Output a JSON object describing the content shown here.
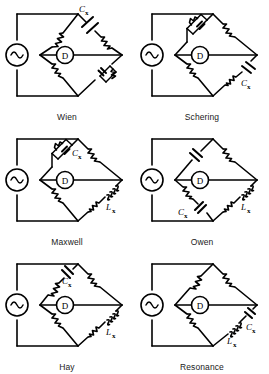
{
  "figure": {
    "ink_color": "#000000",
    "background_color": "#ffffff",
    "columns": 2,
    "rows": 3
  },
  "symbols": {
    "source": "ac-source-sine",
    "detector_label": "D",
    "detector": "detector-circle",
    "resistor": "resistor-zigzag",
    "capacitor": "capacitor-plates",
    "inductor": "inductor-coil"
  },
  "labels": {
    "cx": "C",
    "lx": "L",
    "sub_x": "x"
  },
  "bridges": [
    {
      "id": "wien",
      "name": "Wien",
      "index": 0,
      "detector": "D",
      "source": "ac-source-sine",
      "arms": [
        {
          "position": "top-left",
          "components": [
            "resistor"
          ],
          "label": ""
        },
        {
          "position": "top-right",
          "components": [
            "capacitor",
            "resistor"
          ],
          "label": "Cx"
        },
        {
          "position": "bottom-left",
          "components": [
            "resistor"
          ],
          "label": ""
        },
        {
          "position": "bottom-right",
          "components": [
            "capacitor-parallel-resistor"
          ],
          "label": ""
        }
      ]
    },
    {
      "id": "schering",
      "name": "Schering",
      "index": 1,
      "detector": "D",
      "source": "ac-source-sine",
      "arms": [
        {
          "position": "top-left",
          "components": [
            "resistor-parallel-capacitor"
          ],
          "label": ""
        },
        {
          "position": "top-right",
          "components": [
            "resistor"
          ],
          "label": ""
        },
        {
          "position": "bottom-left",
          "components": [
            "resistor"
          ],
          "label": ""
        },
        {
          "position": "bottom-right",
          "components": [
            "capacitor",
            "resistor"
          ],
          "label": "Cx"
        }
      ]
    },
    {
      "id": "maxwell",
      "name": "Maxwell",
      "index": 2,
      "detector": "D",
      "source": "ac-source-sine",
      "arms": [
        {
          "position": "top-left",
          "components": [
            "resistor-parallel-capacitor"
          ],
          "label": "Cx"
        },
        {
          "position": "top-right",
          "components": [
            "resistor"
          ],
          "label": ""
        },
        {
          "position": "bottom-left",
          "components": [
            "resistor"
          ],
          "label": ""
        },
        {
          "position": "bottom-right",
          "components": [
            "inductor",
            "resistor"
          ],
          "label": "Lx"
        }
      ]
    },
    {
      "id": "owen",
      "name": "Owen",
      "index": 3,
      "detector": "D",
      "source": "ac-source-sine",
      "arms": [
        {
          "position": "top-left",
          "components": [
            "capacitor"
          ],
          "label": ""
        },
        {
          "position": "top-right",
          "components": [
            "resistor"
          ],
          "label": ""
        },
        {
          "position": "bottom-left",
          "components": [
            "resistor",
            "capacitor"
          ],
          "label": "Cx"
        },
        {
          "position": "bottom-right",
          "components": [
            "inductor",
            "resistor"
          ],
          "label": "Lx"
        }
      ]
    },
    {
      "id": "hay",
      "name": "Hay",
      "index": 4,
      "detector": "D",
      "source": "ac-source-sine",
      "arms": [
        {
          "position": "top-left",
          "components": [
            "capacitor",
            "resistor"
          ],
          "label": "Cx"
        },
        {
          "position": "top-right",
          "components": [
            "resistor"
          ],
          "label": ""
        },
        {
          "position": "bottom-left",
          "components": [
            "resistor"
          ],
          "label": ""
        },
        {
          "position": "bottom-right",
          "components": [
            "inductor",
            "resistor"
          ],
          "label": "Lx"
        }
      ]
    },
    {
      "id": "resonance",
      "name": "Resonance",
      "index": 5,
      "detector": "D",
      "source": "ac-source-sine",
      "arms": [
        {
          "position": "top-left",
          "components": [
            "resistor"
          ],
          "label": ""
        },
        {
          "position": "top-right",
          "components": [
            "resistor"
          ],
          "label": ""
        },
        {
          "position": "bottom-left",
          "components": [
            "resistor"
          ],
          "label": ""
        },
        {
          "position": "bottom-right",
          "components": [
            "capacitor",
            "inductor"
          ],
          "label": "Cx Lx"
        }
      ]
    }
  ]
}
